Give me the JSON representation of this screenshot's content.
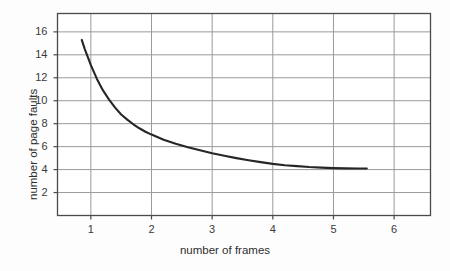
{
  "chart_data": {
    "type": "line",
    "title": "",
    "subtitle": "",
    "xlabel": "number of frames",
    "ylabel": "number of page faults",
    "xlim": [
      0.45,
      6.6
    ],
    "ylim": [
      0.0,
      17.6
    ],
    "xticks": [
      "1",
      "2",
      "3",
      "4",
      "5",
      "6"
    ],
    "xtick_values": [
      1,
      2,
      3,
      4,
      5,
      6
    ],
    "yticks": [
      "2",
      "4",
      "6",
      "8",
      "10",
      "12",
      "14",
      "16"
    ],
    "ytick_values": [
      2,
      4,
      6,
      8,
      10,
      12,
      14,
      16
    ],
    "grid": true,
    "grid_color": "#9a9a9a",
    "legend": "none",
    "line_color": "#262626",
    "line_width": 2.1,
    "series": [
      {
        "name": "page faults vs frames",
        "x": [
          0.85,
          0.9,
          0.95,
          1.0,
          1.1,
          1.2,
          1.3,
          1.4,
          1.5,
          1.6,
          1.7,
          1.8,
          1.9,
          2.0,
          2.2,
          2.4,
          2.6,
          2.8,
          3.0,
          3.2,
          3.4,
          3.6,
          3.8,
          4.0,
          4.2,
          4.4,
          4.6,
          4.8,
          5.0,
          5.2,
          5.4,
          5.55
        ],
        "y": [
          15.3,
          14.5,
          13.8,
          13.1,
          11.9,
          10.9,
          10.1,
          9.4,
          8.8,
          8.35,
          7.95,
          7.6,
          7.3,
          7.05,
          6.6,
          6.25,
          5.95,
          5.68,
          5.42,
          5.2,
          5.0,
          4.82,
          4.65,
          4.5,
          4.38,
          4.3,
          4.22,
          4.17,
          4.13,
          4.11,
          4.1,
          4.1
        ]
      }
    ]
  },
  "axes": {
    "frame_color": "#4a4a4a",
    "background": "#ffffff"
  },
  "figure": {
    "background": "#fdfdfd"
  }
}
